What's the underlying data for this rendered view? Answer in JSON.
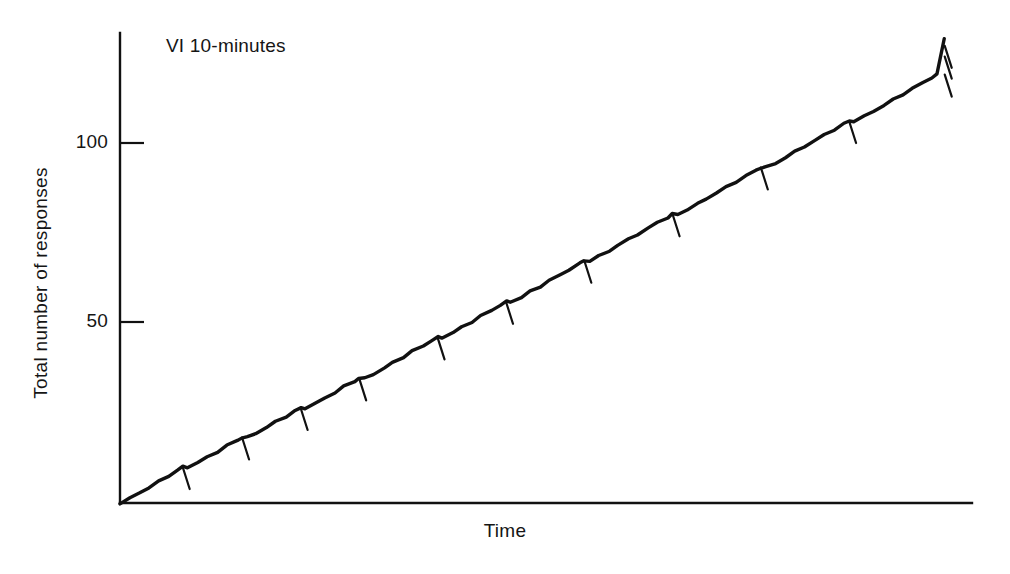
{
  "figure": {
    "background_color": "#ffffff",
    "ink_color": "#111111",
    "width": 1010,
    "height": 574
  },
  "axes": {
    "y_title": "Total number of responses",
    "x_title": "Time",
    "y_ticks": [
      {
        "label": "50",
        "value": 50
      },
      {
        "label": "100",
        "value": 100
      }
    ],
    "x_ticks": []
  },
  "annotation": {
    "text": "VI 10-minutes"
  },
  "chart_data": {
    "type": "line",
    "title": "",
    "subtitle": "",
    "annotations": [
      "VI 10-minutes"
    ],
    "xlabel": "Time",
    "ylabel": "Total number of responses",
    "xlim": [
      0,
      100
    ],
    "ylim": [
      0,
      129
    ],
    "grid": false,
    "legend": "none",
    "x_tick_labels": [],
    "y_tick_labels": [
      "50",
      "100"
    ],
    "y_tick_values": [
      50,
      100
    ],
    "series": [
      {
        "name": "Cumulative responses",
        "x": [
          0.0,
          1.2,
          2.4,
          3.5,
          4.7,
          5.9,
          7.0,
          7.6,
          8.2,
          9.4,
          10.6,
          11.8,
          13.0,
          14.2,
          14.8,
          15.4,
          16.5,
          17.7,
          18.9,
          20.1,
          21.3,
          21.9,
          22.5,
          23.7,
          24.9,
          26.0,
          27.2,
          28.4,
          29.0,
          29.6,
          30.8,
          32.0,
          33.1,
          34.3,
          35.5,
          36.7,
          37.9,
          38.5,
          39.1,
          40.3,
          41.5,
          42.6,
          43.8,
          45.0,
          46.2,
          46.8,
          47.4,
          48.6,
          49.8,
          50.9,
          52.1,
          53.3,
          54.5,
          55.7,
          56.3,
          56.9,
          58.1,
          59.3,
          60.4,
          61.6,
          62.8,
          64.0,
          65.2,
          66.4,
          67.0,
          67.6,
          68.8,
          70.0,
          71.1,
          72.3,
          73.5,
          74.7,
          75.9,
          77.1,
          77.7,
          78.3,
          79.5,
          80.7,
          81.8,
          83.0,
          84.2,
          85.4,
          86.6,
          87.8,
          88.4,
          89.0,
          90.2,
          91.4,
          92.6,
          93.8,
          94.9,
          96.1,
          97.3,
          98.5,
          99.0,
          100.0
        ],
        "y": [
          0.0,
          1.3,
          2.8,
          4.4,
          5.9,
          7.5,
          9.2,
          10.0,
          10.0,
          11.2,
          12.7,
          14.3,
          15.9,
          17.4,
          18.2,
          18.2,
          19.4,
          21.0,
          22.5,
          24.1,
          25.6,
          26.4,
          26.4,
          27.6,
          29.2,
          30.7,
          32.3,
          33.9,
          34.6,
          34.6,
          35.9,
          37.4,
          39.0,
          40.6,
          42.1,
          43.7,
          45.2,
          46.0,
          46.0,
          47.3,
          48.8,
          50.4,
          51.9,
          53.5,
          55.1,
          55.9,
          55.9,
          57.1,
          58.7,
          60.2,
          61.8,
          63.3,
          64.9,
          66.5,
          67.3,
          67.3,
          68.5,
          70.1,
          71.6,
          73.2,
          74.7,
          76.3,
          77.9,
          79.4,
          80.2,
          80.2,
          81.5,
          83.0,
          84.6,
          86.1,
          87.7,
          89.3,
          90.8,
          92.4,
          93.2,
          93.2,
          94.4,
          96.0,
          97.5,
          99.1,
          100.6,
          102.2,
          103.8,
          105.3,
          106.1,
          106.1,
          107.3,
          108.9,
          110.5,
          112.0,
          113.6,
          115.1,
          116.7,
          118.3,
          119.0,
          129.0
        ]
      }
    ],
    "reinforcement_marks": {
      "name": "Reinforcement pips",
      "count": 13,
      "x": [
        7.6,
        14.8,
        21.9,
        29.0,
        38.5,
        46.8,
        56.3,
        67.0,
        77.7,
        88.4,
        100.0,
        100.0,
        100.0
      ],
      "y": [
        10.0,
        18.2,
        26.4,
        34.6,
        46.0,
        55.9,
        67.3,
        80.2,
        93.2,
        106.1,
        119.0,
        124.0,
        127.0
      ]
    }
  }
}
